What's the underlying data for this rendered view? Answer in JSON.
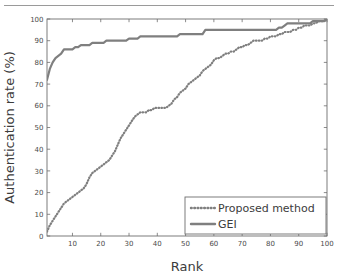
{
  "figure": {
    "name": "cmc-curve-figure",
    "top_rule_color": "#9a9a9a",
    "background": "#ffffff"
  },
  "chart_data": {
    "type": "line",
    "title": "",
    "xlabel": "Rank",
    "ylabel": "Authentication rate (%)",
    "xlim": [
      1,
      100
    ],
    "ylim": [
      0,
      100
    ],
    "xticks": [
      10,
      20,
      30,
      40,
      50,
      60,
      70,
      80,
      90,
      100
    ],
    "yticks": [
      0,
      10,
      20,
      30,
      40,
      50,
      60,
      70,
      80,
      90,
      100
    ],
    "xticklabels": [
      "10",
      "20",
      "30",
      "40",
      "50",
      "60",
      "70",
      "80",
      "90",
      "100"
    ],
    "yticklabels": [
      "0",
      "10",
      "20",
      "30",
      "40",
      "50",
      "60",
      "70",
      "80",
      "90",
      "100"
    ],
    "grid": false,
    "box": true,
    "tick_direction": "in",
    "legend_position": "lower right",
    "axis_color": "#6e6e6e",
    "series": [
      {
        "name": "Proposed method",
        "style": "dotted",
        "color": "#7f7f7f",
        "x": [
          1,
          2,
          3,
          4,
          5,
          6,
          7,
          8,
          9,
          10,
          11,
          12,
          13,
          14,
          15,
          16,
          17,
          18,
          19,
          20,
          21,
          22,
          23,
          24,
          25,
          26,
          27,
          28,
          29,
          30,
          31,
          32,
          33,
          34,
          35,
          36,
          37,
          38,
          39,
          40,
          41,
          42,
          43,
          44,
          45,
          46,
          47,
          48,
          49,
          50,
          51,
          52,
          53,
          54,
          55,
          56,
          57,
          58,
          59,
          60,
          61,
          62,
          63,
          64,
          65,
          66,
          67,
          68,
          69,
          70,
          71,
          72,
          73,
          74,
          75,
          76,
          77,
          78,
          79,
          80,
          81,
          82,
          83,
          84,
          85,
          86,
          87,
          88,
          89,
          90,
          91,
          92,
          93,
          94,
          95,
          96,
          97,
          98,
          99,
          100
        ],
        "values": [
          2,
          5,
          7,
          9,
          11,
          13,
          15,
          16,
          17,
          18,
          19,
          20,
          21,
          22,
          24,
          27,
          29,
          30,
          31,
          32,
          33,
          34,
          35,
          37,
          39,
          42,
          45,
          47,
          49,
          51,
          53,
          55,
          56,
          57,
          57,
          57,
          58,
          58,
          59,
          59,
          59,
          59,
          59,
          60,
          61,
          63,
          64,
          66,
          67,
          68,
          70,
          71,
          72,
          73,
          74,
          76,
          77,
          78,
          79,
          81,
          82,
          82,
          83,
          84,
          84,
          85,
          85,
          86,
          87,
          87,
          88,
          88,
          89,
          90,
          90,
          90,
          90,
          91,
          91,
          92,
          92,
          92,
          93,
          93,
          94,
          94,
          94,
          95,
          95,
          96,
          96,
          97,
          97,
          97,
          98,
          98,
          99,
          99,
          99,
          100
        ]
      },
      {
        "name": "GEI",
        "style": "solid",
        "color": "#7f7f7f",
        "x": [
          1,
          2,
          3,
          4,
          5,
          6,
          7,
          8,
          9,
          10,
          11,
          12,
          13,
          14,
          15,
          16,
          17,
          18,
          19,
          20,
          21,
          22,
          23,
          24,
          25,
          26,
          27,
          28,
          29,
          30,
          31,
          32,
          33,
          34,
          35,
          36,
          37,
          38,
          39,
          40,
          41,
          42,
          43,
          44,
          45,
          46,
          47,
          48,
          49,
          50,
          51,
          52,
          53,
          54,
          55,
          56,
          57,
          58,
          59,
          60,
          61,
          62,
          63,
          64,
          65,
          66,
          67,
          68,
          69,
          70,
          71,
          72,
          73,
          74,
          75,
          76,
          77,
          78,
          79,
          80,
          81,
          82,
          83,
          84,
          85,
          86,
          87,
          88,
          89,
          90,
          91,
          92,
          93,
          94,
          95,
          96,
          97,
          98,
          99,
          100
        ],
        "values": [
          72,
          77,
          80,
          82,
          83,
          84,
          86,
          86,
          86,
          86,
          87,
          87,
          88,
          88,
          88,
          88,
          89,
          89,
          89,
          89,
          89,
          90,
          90,
          90,
          90,
          90,
          90,
          90,
          90,
          91,
          91,
          91,
          91,
          92,
          92,
          92,
          92,
          92,
          92,
          92,
          92,
          92,
          92,
          92,
          92,
          92,
          92,
          93,
          93,
          93,
          93,
          93,
          93,
          93,
          93,
          93,
          95,
          95,
          95,
          95,
          95,
          95,
          95,
          95,
          95,
          95,
          95,
          95,
          95,
          95,
          95,
          95,
          95,
          95,
          95,
          95,
          95,
          95,
          95,
          95,
          95,
          95,
          96,
          96,
          97,
          98,
          98,
          98,
          98,
          98,
          98,
          98,
          98,
          98,
          99,
          99,
          99,
          99,
          99,
          100
        ]
      }
    ],
    "legend": [
      {
        "label": "Proposed method",
        "style": "dotted",
        "color": "#7f7f7f"
      },
      {
        "label": "GEI",
        "style": "solid",
        "color": "#7f7f7f"
      }
    ]
  }
}
